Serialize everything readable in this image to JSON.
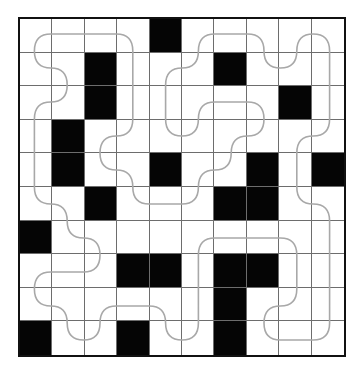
{
  "puzzle": {
    "type": "loop-through-white-cells",
    "rows": 10,
    "cols": 10,
    "black_cells": [
      [
        0,
        4
      ],
      [
        1,
        2
      ],
      [
        1,
        6
      ],
      [
        2,
        2
      ],
      [
        2,
        8
      ],
      [
        3,
        1
      ],
      [
        4,
        1
      ],
      [
        4,
        4
      ],
      [
        4,
        7
      ],
      [
        4,
        9
      ],
      [
        5,
        2
      ],
      [
        5,
        6
      ],
      [
        5,
        7
      ],
      [
        6,
        0
      ],
      [
        7,
        3
      ],
      [
        7,
        4
      ],
      [
        7,
        6
      ],
      [
        7,
        7
      ],
      [
        8,
        6
      ],
      [
        9,
        0
      ],
      [
        9,
        3
      ],
      [
        9,
        6
      ]
    ],
    "colors": {
      "black": "#050505",
      "white": "#ffffff",
      "grid_line": "#6d6d6d",
      "border": "#111111",
      "loop_stroke": "#a8a8a8"
    },
    "loop_path": [
      [
        0,
        0
      ],
      [
        0,
        1
      ],
      [
        0,
        2
      ],
      [
        0,
        3
      ],
      [
        1,
        3
      ],
      [
        2,
        3
      ],
      [
        3,
        3
      ],
      [
        3,
        2
      ],
      [
        4,
        2
      ],
      [
        4,
        3
      ],
      [
        5,
        3
      ],
      [
        5,
        4
      ],
      [
        5,
        5
      ],
      [
        4,
        5
      ],
      [
        4,
        6
      ],
      [
        3,
        6
      ],
      [
        3,
        7
      ],
      [
        2,
        7
      ],
      [
        2,
        6
      ],
      [
        2,
        5
      ],
      [
        3,
        5
      ],
      [
        3,
        4
      ],
      [
        2,
        4
      ],
      [
        1,
        4
      ],
      [
        1,
        5
      ],
      [
        0,
        5
      ],
      [
        0,
        6
      ],
      [
        0,
        7
      ],
      [
        1,
        7
      ],
      [
        1,
        8
      ],
      [
        0,
        8
      ],
      [
        0,
        9
      ],
      [
        1,
        9
      ],
      [
        2,
        9
      ],
      [
        3,
        9
      ],
      [
        3,
        8
      ],
      [
        4,
        8
      ],
      [
        5,
        8
      ],
      [
        5,
        9
      ],
      [
        6,
        9
      ],
      [
        7,
        9
      ],
      [
        8,
        9
      ],
      [
        9,
        9
      ],
      [
        9,
        8
      ],
      [
        9,
        7
      ],
      [
        8,
        7
      ],
      [
        8,
        8
      ],
      [
        7,
        8
      ],
      [
        6,
        8
      ],
      [
        6,
        7
      ],
      [
        6,
        6
      ],
      [
        6,
        5
      ],
      [
        7,
        5
      ],
      [
        8,
        5
      ],
      [
        9,
        5
      ],
      [
        9,
        4
      ],
      [
        8,
        4
      ],
      [
        8,
        3
      ],
      [
        8,
        2
      ],
      [
        9,
        2
      ],
      [
        9,
        1
      ],
      [
        8,
        1
      ],
      [
        8,
        0
      ],
      [
        7,
        0
      ],
      [
        7,
        1
      ],
      [
        7,
        2
      ],
      [
        6,
        2
      ],
      [
        6,
        1
      ],
      [
        5,
        1
      ],
      [
        5,
        0
      ],
      [
        4,
        0
      ],
      [
        3,
        0
      ],
      [
        2,
        0
      ],
      [
        2,
        1
      ],
      [
        1,
        1
      ],
      [
        1,
        0
      ]
    ]
  }
}
